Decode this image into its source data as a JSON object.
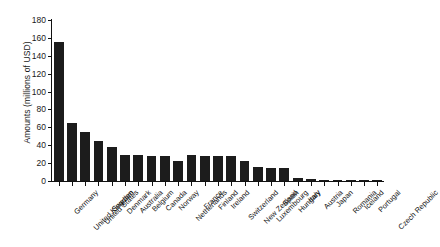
{
  "chart_data": {
    "type": "bar",
    "title": "",
    "xlabel": "",
    "ylabel": "Amounts (millions of USD)",
    "ylim": [
      0,
      180
    ],
    "ytick_step": 20,
    "yticks": [
      0,
      20,
      40,
      60,
      80,
      100,
      120,
      140,
      160,
      180
    ],
    "grid": false,
    "legend": "none",
    "bar_color": "#1c1c1c",
    "axis_color": "#111111",
    "categories": [
      "Germany",
      "United Kingdom",
      "United States",
      "Sweden",
      "Denmark",
      "Australia",
      "Belgium",
      "Canada",
      "Norway",
      "Netherlands",
      "France",
      "Finland",
      "Ireland",
      "Switzerland",
      "New Zealand",
      "Luxembourg",
      "Spain",
      "Hungary",
      "Italy",
      "Austria",
      "Japan",
      "Romania",
      "Iceland",
      "Portugal",
      "Czech Republic"
    ],
    "values": [
      155,
      65,
      55,
      45,
      38,
      29,
      29,
      28,
      28,
      22,
      29,
      28,
      28,
      28,
      22,
      16,
      15,
      15,
      3,
      2,
      1.5,
      1,
      1,
      0.8,
      0.5
    ]
  }
}
